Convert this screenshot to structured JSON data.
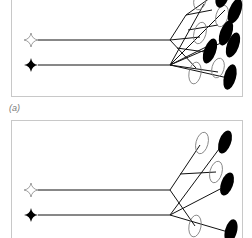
{
  "figure": {
    "panels": [
      {
        "id": "a",
        "label": "(a)",
        "description": "Two input stimuli (hollow star and filled star) each branch to many hollow and filled oval units",
        "inputs": [
          {
            "name": "hollow-star",
            "fill": "#ffffff",
            "y": 40
          },
          {
            "name": "filled-star",
            "fill": "#000000",
            "y": 65
          }
        ],
        "branch_point_x": 170,
        "hollow_ovals": [
          {
            "cx": 200,
            "cy": 0
          },
          {
            "cx": 222,
            "cy": 15
          },
          {
            "cx": 200,
            "cy": 35
          },
          {
            "cx": 196,
            "cy": 73
          },
          {
            "cx": 218,
            "cy": 70
          }
        ],
        "filled_ovals": [
          {
            "cx": 222,
            "cy": -2
          },
          {
            "cx": 235,
            "cy": 12
          },
          {
            "cx": 225,
            "cy": 33
          },
          {
            "cx": 210,
            "cy": 50
          },
          {
            "cx": 233,
            "cy": 45
          },
          {
            "cx": 230,
            "cy": 77
          }
        ]
      },
      {
        "id": "b",
        "label": "(b)",
        "description": "Sparser connectivity: two input stimuli branch to fewer hollow and filled oval units",
        "inputs": [
          {
            "name": "hollow-star",
            "fill": "#ffffff",
            "y": 190
          },
          {
            "name": "filled-star",
            "fill": "#000000",
            "y": 215
          }
        ],
        "branch_point_x": 170,
        "hollow_ovals": [
          {
            "cx": 202,
            "cy": 142
          },
          {
            "cx": 216,
            "cy": 172
          },
          {
            "cx": 195,
            "cy": 226
          }
        ],
        "filled_ovals": [
          {
            "cx": 225,
            "cy": 141
          },
          {
            "cx": 227,
            "cy": 184
          },
          {
            "cx": 231,
            "cy": 230
          }
        ]
      }
    ],
    "colors": {
      "line": "#111111",
      "border": "#c8c8c8",
      "label": "#777777"
    }
  }
}
